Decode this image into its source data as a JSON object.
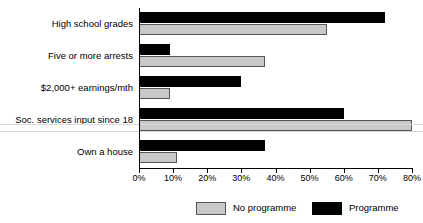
{
  "figure": {
    "cropped_title_remnant": "",
    "axis": {
      "x_start_px": 139,
      "x_end_px": 412
    }
  },
  "chart_data": {
    "type": "bar",
    "orientation": "horizontal",
    "title": "",
    "xlabel": "",
    "ylabel": "",
    "xlim": [
      0,
      80
    ],
    "xticks": [
      0,
      10,
      20,
      30,
      40,
      50,
      60,
      70,
      80
    ],
    "xticklabels": [
      "0%",
      "10%",
      "20%",
      "30%",
      "40%",
      "50%",
      "60%",
      "70%",
      "80%"
    ],
    "grid": false,
    "legend_position": "bottom",
    "categories": [
      "High school grades",
      "Five or more arrests",
      "$2,000+ earnings/mth",
      "Soc. services input since 18",
      "Own a house"
    ],
    "series": [
      {
        "name": "No programme",
        "color": "#c8c8c8",
        "edge_color": "#555555",
        "values": [
          55,
          37,
          9,
          80,
          11
        ]
      },
      {
        "name": "Programme",
        "color": "#000000",
        "edge_color": "#000000",
        "values": [
          72,
          9,
          30,
          60,
          37
        ]
      }
    ]
  },
  "legend": {
    "items": [
      {
        "label": "No programme"
      },
      {
        "label": "Programme"
      }
    ]
  }
}
